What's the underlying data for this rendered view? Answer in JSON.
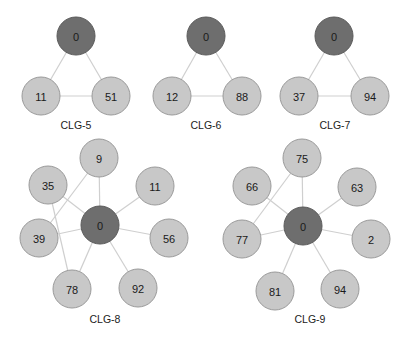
{
  "colors": {
    "center_node": "#6e6e6e",
    "leaf_node": "#c8c8c8",
    "edge": "#cfcfcf"
  },
  "graphs": [
    {
      "label": "CLG-5",
      "label_pos": [
        76,
        129
      ],
      "nodes": [
        {
          "id": "0",
          "x": 76,
          "y": 36,
          "center": true
        },
        {
          "id": "11",
          "x": 41,
          "y": 96
        },
        {
          "id": "51",
          "x": 111,
          "y": 96
        }
      ],
      "edges": [
        [
          "0",
          "11"
        ],
        [
          "0",
          "51"
        ],
        [
          "11",
          "51"
        ]
      ]
    },
    {
      "label": "CLG-6",
      "label_pos": [
        206,
        129
      ],
      "nodes": [
        {
          "id": "0",
          "x": 206,
          "y": 36,
          "center": true
        },
        {
          "id": "12",
          "x": 172,
          "y": 96
        },
        {
          "id": "88",
          "x": 242,
          "y": 96
        }
      ],
      "edges": [
        [
          "0",
          "12"
        ],
        [
          "0",
          "88"
        ],
        [
          "12",
          "88"
        ]
      ]
    },
    {
      "label": "CLG-7",
      "label_pos": [
        335,
        129
      ],
      "nodes": [
        {
          "id": "0",
          "x": 334,
          "y": 36,
          "center": true
        },
        {
          "id": "37",
          "x": 299,
          "y": 96
        },
        {
          "id": "94",
          "x": 370,
          "y": 96
        }
      ],
      "edges": [
        [
          "0",
          "37"
        ],
        [
          "0",
          "94"
        ],
        [
          "37",
          "94"
        ]
      ]
    },
    {
      "label": "CLG-8",
      "label_pos": [
        105,
        323
      ],
      "nodes": [
        {
          "id": "0",
          "x": 100,
          "y": 225,
          "center": true
        },
        {
          "id": "9",
          "x": 99,
          "y": 158
        },
        {
          "id": "35",
          "x": 48,
          "y": 185
        },
        {
          "id": "11",
          "x": 155,
          "y": 186
        },
        {
          "id": "39",
          "x": 39,
          "y": 238
        },
        {
          "id": "56",
          "x": 169,
          "y": 238
        },
        {
          "id": "78",
          "x": 72,
          "y": 289
        },
        {
          "id": "92",
          "x": 138,
          "y": 288
        }
      ],
      "edges": [
        [
          "0",
          "9"
        ],
        [
          "0",
          "35"
        ],
        [
          "0",
          "11"
        ],
        [
          "0",
          "39"
        ],
        [
          "0",
          "56"
        ],
        [
          "0",
          "78"
        ],
        [
          "0",
          "92"
        ],
        [
          "9",
          "39"
        ],
        [
          "35",
          "78"
        ]
      ]
    },
    {
      "label": "CLG-9",
      "label_pos": [
        310,
        323
      ],
      "nodes": [
        {
          "id": "0",
          "x": 303,
          "y": 226,
          "center": true
        },
        {
          "id": "75",
          "x": 302,
          "y": 158
        },
        {
          "id": "66",
          "x": 252,
          "y": 186
        },
        {
          "id": "63",
          "x": 357,
          "y": 187
        },
        {
          "id": "77",
          "x": 242,
          "y": 239
        },
        {
          "id": "2",
          "x": 371,
          "y": 239
        },
        {
          "id": "81",
          "x": 275,
          "y": 291
        },
        {
          "id": "94",
          "x": 340,
          "y": 289
        }
      ],
      "edges": [
        [
          "0",
          "75"
        ],
        [
          "0",
          "66"
        ],
        [
          "0",
          "63"
        ],
        [
          "0",
          "77"
        ],
        [
          "0",
          "2"
        ],
        [
          "0",
          "81"
        ],
        [
          "0",
          "94"
        ],
        [
          "75",
          "77"
        ]
      ]
    }
  ],
  "node_radius": 19
}
